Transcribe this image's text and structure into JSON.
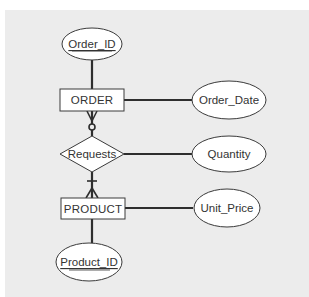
{
  "diagram": {
    "type": "entity-relationship",
    "notation": "crows-foot",
    "colors": {
      "panel_background": "#ececec",
      "shape_fill": "#ffffff",
      "line": "#2e2e2e",
      "text": "#333333"
    },
    "entities": [
      {
        "id": "order",
        "label": "ORDER"
      },
      {
        "id": "product",
        "label": "PRODUCT"
      }
    ],
    "relationships": [
      {
        "id": "requests",
        "label": "Requests"
      }
    ],
    "attributes": [
      {
        "id": "order_id",
        "label": "Order_ID",
        "owner": "ORDER",
        "key": true
      },
      {
        "id": "order_date",
        "label": "Order_Date",
        "owner": "ORDER",
        "key": false
      },
      {
        "id": "quantity",
        "label": "Quantity",
        "owner": "Requests",
        "key": false
      },
      {
        "id": "unit_price",
        "label": "Unit_Price",
        "owner": "PRODUCT",
        "key": false
      },
      {
        "id": "product_id",
        "label": "Product_ID",
        "owner": "PRODUCT",
        "key": true
      }
    ],
    "connections": [
      {
        "from": "ORDER",
        "to": "Requests",
        "cardinality_at_order": "zero-or-many"
      },
      {
        "from": "Requests",
        "to": "PRODUCT",
        "cardinality_at_product": "one-or-many"
      }
    ]
  }
}
